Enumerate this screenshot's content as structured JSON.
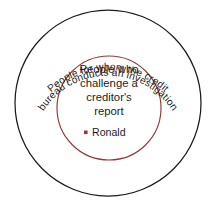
{
  "diagram": {
    "type": "nested-set-venn",
    "background_color": "#ffffff",
    "outer_set": {
      "name": "outer-set",
      "stroke_color": "#1a1a1a",
      "label_line_1": "People for whom the credit",
      "label_line_2": "bureau conducts an investigation",
      "label_placement": "curved-along-top-arc"
    },
    "inner_set": {
      "name": "inner-set",
      "stroke_color": "#8e3b3b",
      "label_line_1": "People who",
      "label_line_2": "challenge a",
      "label_line_3": "creditor's",
      "label_line_4": "report",
      "label_placement": "centered-horizontal"
    },
    "members": [
      {
        "label": "Ronald",
        "bullet_color": "#8e3b3b",
        "belongs_to": "inner-set"
      }
    ]
  }
}
